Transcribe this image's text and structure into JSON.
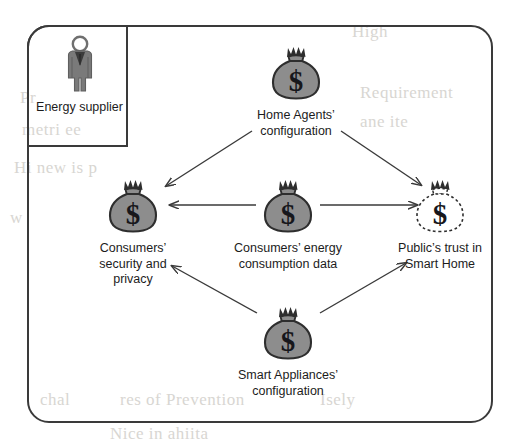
{
  "diagram": {
    "frame": {
      "name": "smart-home-boundary"
    },
    "colors": {
      "bag_fill": "#8d8d8d",
      "bag_stroke": "#2e2e2e",
      "bag_dashed_fill": "#ffffff",
      "line": "#3a3a3a",
      "text": "#1c1c1c",
      "person_fill": "#7a7a7a"
    },
    "supplier": {
      "label": "Energy\nsupplier",
      "icon": "person-icon"
    },
    "nodes": [
      {
        "id": "home-agents",
        "label": "Home Agents’\nconfiguration",
        "icon": "money-bag-icon",
        "style": "solid",
        "x": 296,
        "y": 45
      },
      {
        "id": "consumers-security",
        "label": "Consumers’\nsecurity and\nprivacy",
        "icon": "money-bag-icon",
        "style": "solid",
        "x": 133,
        "y": 178
      },
      {
        "id": "consumers-energy-data",
        "label": "Consumers’ energy\nconsumption data",
        "icon": "money-bag-icon",
        "style": "solid",
        "x": 288,
        "y": 178
      },
      {
        "id": "public-trust",
        "label": "Public’s trust in\nSmart Home",
        "icon": "money-bag-dashed-icon",
        "style": "dashed",
        "x": 440,
        "y": 178
      },
      {
        "id": "smart-appliances",
        "label": "Smart Appliances’\nconfiguration",
        "icon": "money-bag-icon",
        "style": "solid",
        "x": 288,
        "y": 305
      }
    ],
    "edges": [
      {
        "id": "home-agents-to-consumers-security",
        "from": "home-agents",
        "to": "consumers-security",
        "arrow": "single"
      },
      {
        "id": "home-agents-to-public-trust",
        "from": "home-agents",
        "to": "public-trust",
        "arrow": "single"
      },
      {
        "id": "energy-data-to-consumers-security",
        "from": "consumers-energy-data",
        "to": "consumers-security",
        "arrow": "single"
      },
      {
        "id": "energy-data-to-public-trust",
        "from": "consumers-energy-data",
        "to": "public-trust",
        "arrow": "single"
      },
      {
        "id": "appliances-to-consumers-security",
        "from": "smart-appliances",
        "to": "consumers-security",
        "arrow": "single"
      },
      {
        "id": "appliances-to-public-trust",
        "from": "smart-appliances",
        "to": "public-trust",
        "arrow": "single"
      }
    ],
    "background_bleed": [
      {
        "text": "High",
        "x": 352,
        "y": 22
      },
      {
        "text": "Pr",
        "x": 20,
        "y": 88
      },
      {
        "text": "Requirement",
        "x": 360,
        "y": 83
      },
      {
        "text": "metri ee",
        "x": 22,
        "y": 120
      },
      {
        "text": "ane ite",
        "x": 360,
        "y": 112
      },
      {
        "text": "Hi new is p",
        "x": 14,
        "y": 158
      },
      {
        "text": "w",
        "x": 10,
        "y": 208
      },
      {
        "text": "chal",
        "x": 40,
        "y": 390
      },
      {
        "text": "res of Prevention",
        "x": 120,
        "y": 390
      },
      {
        "text": "Isely",
        "x": 320,
        "y": 390
      },
      {
        "text": "Nice in ahiita",
        "x": 110,
        "y": 424
      }
    ]
  }
}
